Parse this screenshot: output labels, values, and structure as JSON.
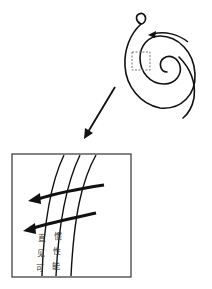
{
  "diagram": {
    "type": "spiral-with-zoom-inset",
    "colors": {
      "stroke": "#111111",
      "dashed_box": "#777777",
      "background": "#ffffff"
    },
    "spiral": {
      "description": "spiral curve with small loop at top, rotation arrow",
      "rotation_direction": "counterclockwise-arrow-top"
    },
    "zoom_indicator": {
      "style": "dashed rectangle"
    },
    "inset": {
      "lanes": 2,
      "arrows": 2,
      "lane_labels": [
        [
          "直",
          "见",
          "可"
        ],
        [
          "惯",
          "性",
          "能"
        ]
      ]
    }
  }
}
